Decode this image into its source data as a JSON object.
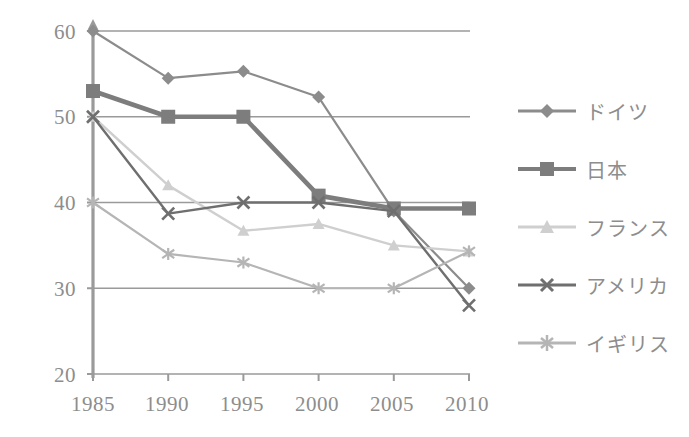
{
  "chart_data": {
    "type": "line",
    "title": "",
    "xlabel": "",
    "ylabel": "",
    "categories": [
      "1985",
      "1990",
      "1995",
      "2000",
      "2005",
      "2010"
    ],
    "x_tick_labels": [
      "1985",
      "1990",
      "1995",
      "2000",
      "2005",
      "2010"
    ],
    "y_tick_labels": [
      "20",
      "30",
      "40",
      "50",
      "60"
    ],
    "y_ticks": [
      20,
      30,
      40,
      50,
      60
    ],
    "ylim": [
      20,
      60
    ],
    "grid": true,
    "legend_position": "right",
    "series": [
      {
        "name": "ドイツ",
        "marker": "diamond",
        "color": "#8c8c8c",
        "values": [
          60,
          54.5,
          55.3,
          52.3,
          39,
          30
        ]
      },
      {
        "name": "日本",
        "marker": "square",
        "color": "#7d7d7d",
        "values": [
          53,
          50,
          50,
          40.8,
          39.3,
          39.3
        ]
      },
      {
        "name": "フランス",
        "marker": "triangle",
        "color": "#cfcfcf",
        "values": [
          50,
          42,
          36.7,
          37.5,
          35,
          34.3
        ]
      },
      {
        "name": "アメリカ",
        "marker": "x",
        "color": "#6f6f6f",
        "values": [
          50,
          38.7,
          40,
          40,
          39,
          28
        ]
      },
      {
        "name": "イギリス",
        "marker": "asterisk",
        "color": "#b5b5b5",
        "values": [
          40,
          34,
          33,
          30,
          30,
          34.3
        ]
      }
    ]
  },
  "axis": {
    "y_labels": [
      "60",
      "50",
      "40",
      "30",
      "20"
    ],
    "x_labels": [
      "1985",
      "1990",
      "1995",
      "2000",
      "2005",
      "2010"
    ]
  },
  "legend": {
    "items": [
      {
        "label": "ドイツ",
        "marker": "diamond-marker-icon"
      },
      {
        "label": "日本",
        "marker": "square-marker-icon"
      },
      {
        "label": "フランス",
        "marker": "triangle-marker-icon"
      },
      {
        "label": "アメリカ",
        "marker": "x-marker-icon"
      },
      {
        "label": "イギリス",
        "marker": "asterisk-marker-icon"
      }
    ]
  },
  "colors": {
    "axis": "#9a9a9a",
    "grid": "#9a9a9a",
    "text": "#8d8d8d",
    "germany": "#8c8c8c",
    "japan": "#7d7d7d",
    "france": "#cfcfcf",
    "usa": "#6f6f6f",
    "uk": "#b5b5b5"
  }
}
